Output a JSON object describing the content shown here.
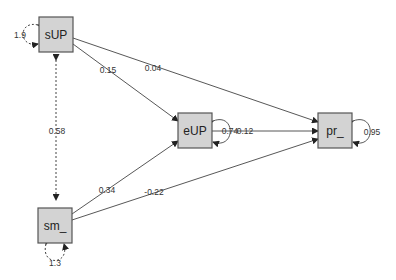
{
  "diagram": {
    "type": "path-diagram",
    "nodes": [
      {
        "id": "sUP",
        "label": "sUP"
      },
      {
        "id": "eUP",
        "label": "eUP"
      },
      {
        "id": "pr_",
        "label": "pr_"
      },
      {
        "id": "sm_",
        "label": "sm_"
      }
    ],
    "paths": [
      {
        "from": "sUP",
        "to": "eUP",
        "label": "0.15"
      },
      {
        "from": "sUP",
        "to": "pr_",
        "label": "0.04"
      },
      {
        "from": "eUP",
        "to": "pr_",
        "label": "0.12"
      },
      {
        "from": "sm_",
        "to": "eUP",
        "label": "0.34"
      },
      {
        "from": "sm_",
        "to": "pr_",
        "label": "-0.22"
      }
    ],
    "covariances": [
      {
        "between": [
          "sUP",
          "sm_"
        ],
        "label": "0.58",
        "style": "dashed"
      }
    ],
    "variances": [
      {
        "node": "sUP",
        "label": "1.9",
        "style": "dashed"
      },
      {
        "node": "sm_",
        "label": "1.3",
        "style": "dashed"
      },
      {
        "node": "eUP",
        "label": "0.74",
        "style": "solid"
      },
      {
        "node": "pr_",
        "label": "0.95",
        "style": "solid"
      }
    ]
  }
}
